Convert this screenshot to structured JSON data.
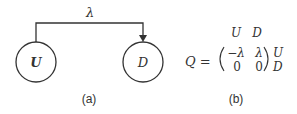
{
  "diagram_a": {
    "nodes": [
      {
        "id": "U",
        "label": "U",
        "bold": true
      },
      {
        "id": "D",
        "label": "D",
        "bold": false
      }
    ],
    "edge": {
      "from": "U",
      "to": "D",
      "label": "λ"
    },
    "caption": "(a)"
  },
  "diagram_b": {
    "lhs": "Q =",
    "column_headers": [
      "U",
      "D"
    ],
    "row_headers": [
      "U",
      "D"
    ],
    "matrix": [
      [
        "−λ",
        "λ"
      ],
      [
        "0",
        "0"
      ]
    ],
    "caption": "(b)"
  }
}
